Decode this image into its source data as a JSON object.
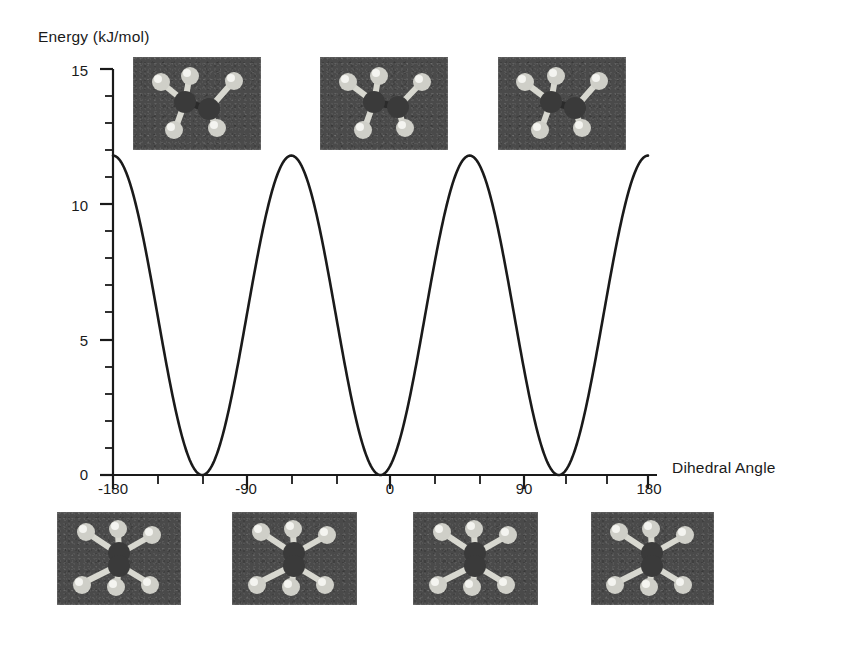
{
  "figure": {
    "title": "",
    "background_color": "#ffffff",
    "curve_color": "#1a1a1a",
    "axis_color": "#1a1a1a",
    "thumbnail_background": "#4a4a4a"
  },
  "axes": {
    "y_label": "Energy (kJ/mol)",
    "x_label": "Dihedral Angle",
    "y_ticks": [
      "0",
      "5",
      "10",
      "15"
    ],
    "x_ticks": [
      "-180",
      "-90",
      "0",
      "90",
      "180"
    ]
  },
  "chart_data": {
    "type": "line",
    "title": "",
    "xlabel": "Dihedral Angle",
    "ylabel": "Energy (kJ/mol)",
    "xlim": [
      -180,
      180
    ],
    "ylim": [
      0,
      15
    ],
    "xticks": [
      -180,
      -90,
      0,
      90,
      180
    ],
    "yticks": [
      0,
      5,
      10,
      15
    ],
    "x_minor_tick_interval": 30,
    "y_minor_tick_interval": 1,
    "grid": false,
    "legend": false,
    "barrier_height": 11.8,
    "minimum_energy": 0,
    "period_degrees": 120,
    "maxima_x": [
      -120,
      0,
      120
    ],
    "maxima_y": [
      11.8,
      11.8,
      11.8
    ],
    "minima_x": [
      -180,
      -60,
      60,
      180
    ],
    "minima_y": [
      0,
      0,
      0,
      0
    ],
    "series": [
      {
        "name": "Torsional energy",
        "x": [
          -180,
          -175,
          -170,
          -165,
          -160,
          -155,
          -150,
          -145,
          -140,
          -135,
          -130,
          -125,
          -120,
          -115,
          -110,
          -105,
          -100,
          -95,
          -90,
          -85,
          -80,
          -75,
          -70,
          -65,
          -60,
          -55,
          -50,
          -45,
          -40,
          -35,
          -30,
          -25,
          -20,
          -15,
          -10,
          -5,
          0,
          5,
          10,
          15,
          20,
          25,
          30,
          35,
          40,
          45,
          50,
          55,
          60,
          65,
          70,
          75,
          80,
          85,
          90,
          95,
          100,
          105,
          110,
          115,
          120,
          125,
          130,
          135,
          140,
          145,
          150,
          155,
          160,
          165,
          170,
          175,
          180
        ],
        "y": [
          0.0,
          0.04,
          0.16,
          0.35,
          0.62,
          0.95,
          1.33,
          1.76,
          2.22,
          2.7,
          3.19,
          3.68,
          4.15,
          4.61,
          5.04,
          5.42,
          5.76,
          6.04,
          6.26,
          6.42,
          6.51,
          6.53,
          6.48,
          6.36,
          6.18,
          5.94,
          5.64,
          5.29,
          4.9,
          4.47,
          4.02,
          3.55,
          3.07,
          2.59,
          2.11,
          1.66,
          1.23,
          0.84,
          0.51,
          0.24,
          0.05,
          0.0,
          0.0,
          0.05,
          0.24,
          0.51,
          0.84,
          1.23,
          1.66,
          2.11,
          2.59,
          3.07,
          3.55,
          4.02,
          4.47,
          4.9,
          5.29,
          5.64,
          5.94,
          6.18,
          6.36,
          6.48,
          6.53,
          6.51,
          6.42,
          6.26,
          6.04,
          5.76,
          5.42,
          5.04,
          4.61,
          4.15,
          0.0
        ]
      }
    ],
    "curve_equation": "E = 5.9 * (1 - cos(3 * phi)) kJ/mol",
    "note": "Threefold periodic torsional potential for ethane: eclipsed maxima at -120, 0, +120 degrees; staggered minima at -180, -60, +60, +180 degrees."
  },
  "conformers": {
    "top_row_label": "eclipsed",
    "bottom_row_label": "staggered",
    "top": [
      {
        "name": "eclipsed-conformer-minus-120",
        "angle": "-120",
        "type": "eclipsed"
      },
      {
        "name": "eclipsed-conformer-0",
        "angle": "0",
        "type": "eclipsed"
      },
      {
        "name": "eclipsed-conformer-plus-120",
        "angle": "120",
        "type": "eclipsed"
      }
    ],
    "bottom": [
      {
        "name": "staggered-conformer-minus-180",
        "angle": "-180",
        "type": "staggered"
      },
      {
        "name": "staggered-conformer-minus-60",
        "angle": "-60",
        "type": "staggered"
      },
      {
        "name": "staggered-conformer-plus-60",
        "angle": "60",
        "type": "staggered"
      },
      {
        "name": "staggered-conformer-plus-180",
        "angle": "180",
        "type": "staggered"
      }
    ]
  }
}
